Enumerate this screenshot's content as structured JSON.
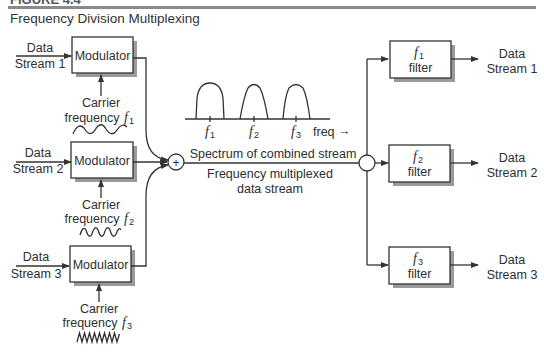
{
  "header": {
    "cut_text": "FIGURE 4.4",
    "title": "Frequency Division Multiplexing"
  },
  "inputs": [
    {
      "line1": "Data",
      "line2": "Stream 1"
    },
    {
      "line1": "Data",
      "line2": "Stream 2"
    },
    {
      "line1": "Data",
      "line2": "Stream 3"
    }
  ],
  "modulators": [
    {
      "label": "Modulator",
      "carrier_line1": "Carrier",
      "carrier_line2": "frequency",
      "freq_symbol": "f",
      "freq_sub": "1"
    },
    {
      "label": "Modulator",
      "carrier_line1": "Carrier",
      "carrier_line2": "frequency",
      "freq_symbol": "f",
      "freq_sub": "2"
    },
    {
      "label": "Modulator",
      "carrier_line1": "Carrier",
      "carrier_line2": "frequency",
      "freq_symbol": "f",
      "freq_sub": "3"
    }
  ],
  "combiner": {
    "symbol": "+"
  },
  "spectrum": {
    "ticks": [
      {
        "symbol": "f",
        "sub": "1"
      },
      {
        "symbol": "f",
        "sub": "2"
      },
      {
        "symbol": "f",
        "sub": "3"
      }
    ],
    "axis_label": "freq",
    "axis_arrow": "→",
    "caption": "Spectrum of combined stream"
  },
  "multiplexed": {
    "line1": "Frequency multiplexed",
    "line2": "data stream"
  },
  "filters": [
    {
      "symbol": "f",
      "sub": "1",
      "label": "filter"
    },
    {
      "symbol": "f",
      "sub": "2",
      "label": "filter"
    },
    {
      "symbol": "f",
      "sub": "3",
      "label": "filter"
    }
  ],
  "outputs": [
    {
      "line1": "Data",
      "line2": "Stream 1"
    },
    {
      "line1": "Data",
      "line2": "Stream 2"
    },
    {
      "line1": "Data",
      "line2": "Stream 3"
    }
  ]
}
